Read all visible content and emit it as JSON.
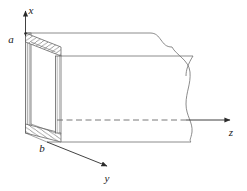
{
  "figure": {
    "kind": "rectangular-waveguide-3d-diagram",
    "background_color": "#ffffff",
    "line_color": "#4a4a4a",
    "hatch_color": "#5a5a5a",
    "label_color": "#1a1a1a"
  },
  "axes": {
    "x": {
      "label": "x",
      "label_x": 31,
      "label_y": 14
    },
    "y": {
      "label": "y",
      "label_x": 103,
      "label_y": 181
    },
    "z": {
      "label": "z",
      "label_x": 230,
      "label_y": 136
    }
  },
  "dimensions": {
    "a": {
      "label": "a",
      "label_x": 9,
      "label_y": 43
    },
    "b": {
      "label": "b",
      "label_x": 40,
      "label_y": 150
    }
  }
}
